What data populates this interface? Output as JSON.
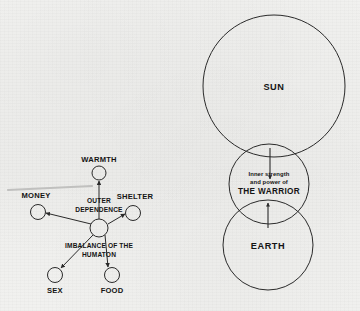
{
  "page": {
    "background_color": "#f1f1ef",
    "ink_color": "#2a2a2a",
    "width": 360,
    "height": 311
  },
  "left_diagram": {
    "name": "outer-dependence-humaton-diagram",
    "hub": {
      "label_above": "OUTER",
      "label_above_2": "DEPENDENCE",
      "label_below": "IMBALANCE OF THE",
      "label_below_2": "HUMATON",
      "cx": 99,
      "cy": 228,
      "r": 9
    },
    "nodes": [
      {
        "id": "warmth",
        "label": "WARMTH",
        "cx": 99,
        "cy": 173,
        "r": 7,
        "label_x": 99,
        "label_y": 160
      },
      {
        "id": "money",
        "label": "MONEY",
        "cx": 38,
        "cy": 212,
        "r": 7.5,
        "label_x": 36,
        "label_y": 196
      },
      {
        "id": "shelter",
        "label": "SHELTER",
        "cx": 133,
        "cy": 213,
        "r": 7.5,
        "label_x": 135,
        "label_y": 197
      },
      {
        "id": "sex",
        "label": "SEX",
        "cx": 55,
        "cy": 275,
        "r": 7.5,
        "label_x": 55,
        "label_y": 291
      },
      {
        "id": "food",
        "label": "FOOD",
        "cx": 112,
        "cy": 275,
        "r": 7.5,
        "label_x": 112,
        "label_y": 291
      }
    ]
  },
  "right_diagram": {
    "name": "sun-warrior-earth-diagram",
    "circles": [
      {
        "id": "sun",
        "label": "SUN",
        "cx": 274,
        "cy": 86,
        "r": 71,
        "label_x": 274,
        "label_y": 88
      },
      {
        "id": "warrior",
        "label_line1": "Inner strength",
        "label_line2": "and power of",
        "label_line3": "THE WARRIOR",
        "cx": 269,
        "cy": 184,
        "r": 40,
        "label_x": 269,
        "label_y": 178
      },
      {
        "id": "earth",
        "label": "EARTH",
        "cx": 268,
        "cy": 245,
        "r": 45,
        "label_x": 268,
        "label_y": 247
      }
    ],
    "arrows": [
      {
        "id": "sun-to-warrior",
        "direction": "down",
        "x": 270,
        "y1": 148,
        "y2": 179
      },
      {
        "id": "earth-to-warrior",
        "direction": "up",
        "x": 268,
        "y1": 228,
        "y2": 203
      }
    ]
  }
}
